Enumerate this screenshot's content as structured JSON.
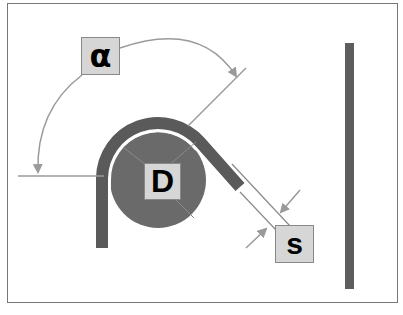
{
  "diagram": {
    "labels": {
      "angle": "α",
      "diameter": "D",
      "gap": "s"
    },
    "colors": {
      "wire": "#5a5a5a",
      "mandrel": "#6a6a6a",
      "guide_line": "#9a9a9a",
      "label_bg": "#d6d6d6",
      "frame": "#777777"
    }
  }
}
